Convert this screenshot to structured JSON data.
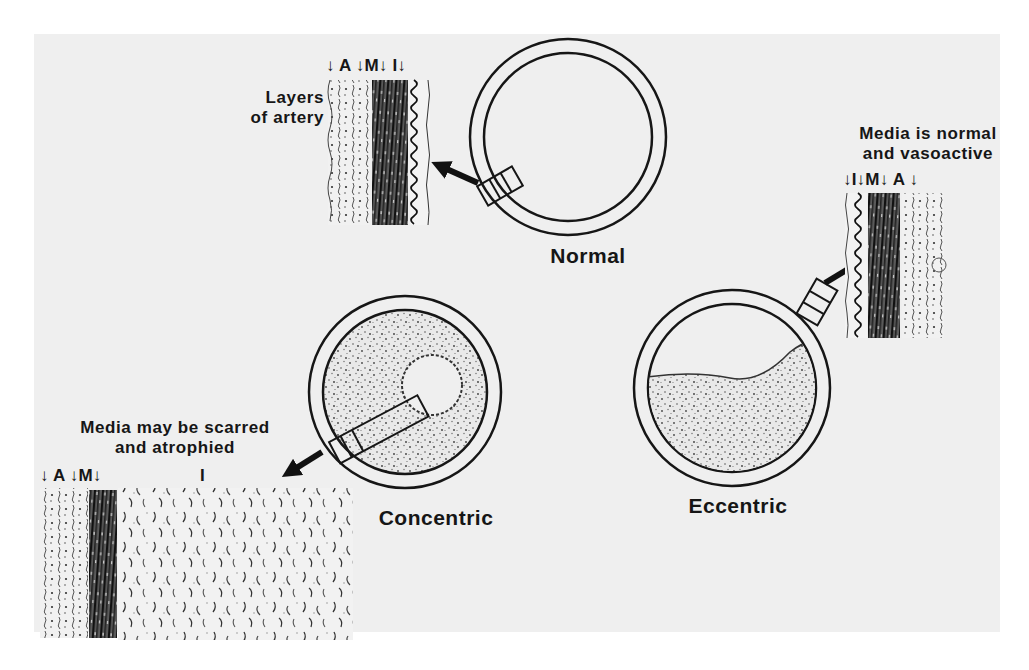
{
  "figure": {
    "background_color": "#efefef",
    "ink_color": "#161616",
    "panels": {
      "normal": {
        "title": "Normal",
        "callout": [
          "Layers",
          "of artery"
        ],
        "layer_labels": "↓ A ↓M↓ I↓",
        "layers_order": [
          "A",
          "M",
          "I"
        ]
      },
      "eccentric": {
        "title": "Eccentric",
        "callout": [
          "Media is normal",
          "and vasoactive"
        ],
        "layer_labels": "↓I↓M↓ A ↓",
        "layers_order": [
          "I",
          "M",
          "A"
        ]
      },
      "concentric": {
        "title": "Concentric",
        "callout": [
          "Media may be scarred",
          "and atrophied"
        ],
        "layer_labels": "↓ A ↓M↓",
        "intima_label": "I",
        "layers_order": [
          "A",
          "M",
          "I"
        ]
      }
    },
    "legend": {
      "A": "Adventitia",
      "M": "Media",
      "I": "Intima"
    }
  }
}
